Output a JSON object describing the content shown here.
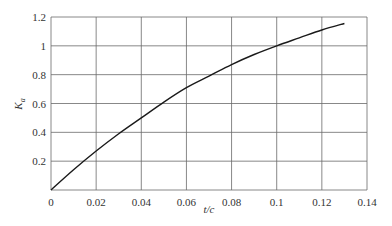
{
  "chart_data": {
    "type": "line",
    "title": "",
    "xlabel": "t/c",
    "ylabel": "K_a",
    "ylabel_main": "K",
    "ylabel_sub": "a",
    "xlim": [
      0,
      0.14
    ],
    "ylim": [
      0,
      1.2
    ],
    "grid": true,
    "legend": null,
    "x_ticks": [
      "0",
      "0.02",
      "0.04",
      "0.06",
      "0.08",
      "0.1",
      "0.12",
      "0.14"
    ],
    "y_ticks": [
      "0.2",
      "0.4",
      "0.6",
      "0.8",
      "1",
      "1.2"
    ],
    "series": [
      {
        "name": "K_a",
        "x": [
          0,
          0.01,
          0.02,
          0.03,
          0.04,
          0.05,
          0.06,
          0.07,
          0.08,
          0.09,
          0.1,
          0.11,
          0.12,
          0.13
        ],
        "values": [
          0,
          0.14,
          0.27,
          0.39,
          0.5,
          0.61,
          0.71,
          0.79,
          0.87,
          0.94,
          1.0,
          1.055,
          1.11,
          1.155
        ]
      }
    ]
  }
}
